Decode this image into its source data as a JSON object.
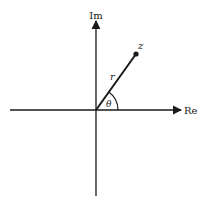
{
  "diagram": {
    "type": "complex-plane-polar",
    "axes": {
      "horizontal_label": "Re",
      "vertical_label": "Im"
    },
    "point": {
      "label": "z"
    },
    "vector": {
      "modulus_label": "r",
      "angle_label": "θ"
    },
    "colors": {
      "stroke": "#1a1a1a",
      "background": "#ffffff"
    }
  }
}
